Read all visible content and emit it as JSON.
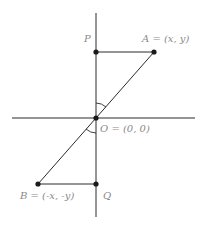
{
  "diagram": {
    "colors": {
      "line": "#2a2a2a",
      "label": "#8a8a8a",
      "background": "#ffffff"
    },
    "axes": {
      "horizontal": {
        "x1": 12,
        "y1": 118,
        "x2": 195,
        "y2": 118
      },
      "vertical": {
        "x1": 96,
        "y1": 13,
        "x2": 96,
        "y2": 217
      }
    },
    "points": {
      "O": {
        "x": 96,
        "y": 118,
        "label": "O = (0, 0)"
      },
      "A": {
        "x": 154,
        "y": 52,
        "label": "A = (x, y)"
      },
      "P": {
        "x": 96,
        "y": 52,
        "label": "P"
      },
      "B": {
        "x": 38,
        "y": 184,
        "label": "B = (-x, -y)"
      },
      "Q": {
        "x": 96,
        "y": 184,
        "label": "Q"
      }
    },
    "segments": [
      "P-A",
      "A-B (through O)",
      "B-Q"
    ],
    "angle_marks": [
      "angle POA",
      "angle QOB"
    ]
  }
}
